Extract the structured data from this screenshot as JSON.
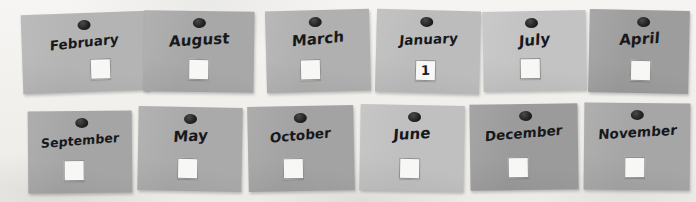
{
  "board": {
    "name": "month-cards-board",
    "background_color": "#f2f1ee",
    "pin_color": "#1f1f1f",
    "checkbox_color": "#f7f7f5",
    "ink_color": "#17181a"
  },
  "cards": [
    {
      "month": "February",
      "color": "#b4b4b4",
      "mark": "",
      "x": 22,
      "y": 13,
      "w": 126,
      "h": 79,
      "rot": -2.0,
      "pin_left": 50,
      "box_left": 62
    },
    {
      "month": "August",
      "color": "#a8a8a8",
      "mark": "",
      "x": 144,
      "y": 11,
      "w": 110,
      "h": 81,
      "rot": 0.8,
      "pin_left": 50,
      "box_left": 50
    },
    {
      "month": "March",
      "color": "#b0b0b0",
      "mark": "",
      "x": 266,
      "y": 10,
      "w": 104,
      "h": 82,
      "rot": -1.5,
      "pin_left": 48,
      "box_left": 42
    },
    {
      "month": "January",
      "color": "#bcbcbc",
      "mark": "1",
      "x": 376,
      "y": 10,
      "w": 104,
      "h": 83,
      "rot": 1.5,
      "pin_left": 48,
      "box_left": 48
    },
    {
      "month": "July",
      "color": "#c3c3c3",
      "mark": "",
      "x": 483,
      "y": 11,
      "w": 103,
      "h": 80,
      "rot": -1.0,
      "pin_left": 48,
      "box_left": 46
    },
    {
      "month": "April",
      "color": "#9d9d9d",
      "mark": "",
      "x": 589,
      "y": 10,
      "w": 100,
      "h": 83,
      "rot": 1.2,
      "pin_left": 54,
      "box_left": 52
    },
    {
      "month": "September",
      "color": "#a5a5a5",
      "mark": "",
      "x": 28,
      "y": 111,
      "w": 104,
      "h": 82,
      "rot": -0.5,
      "pin_left": 52,
      "box_left": 44
    },
    {
      "month": "May",
      "color": "#aaaaaa",
      "mark": "",
      "x": 138,
      "y": 107,
      "w": 104,
      "h": 84,
      "rot": 1.0,
      "pin_left": 50,
      "box_left": 48
    },
    {
      "month": "October",
      "color": "#a3a3a3",
      "mark": "",
      "x": 248,
      "y": 106,
      "w": 106,
      "h": 85,
      "rot": -1.2,
      "pin_left": 50,
      "box_left": 42
    },
    {
      "month": "June",
      "color": "#c0c0c0",
      "mark": "",
      "x": 360,
      "y": 105,
      "w": 104,
      "h": 86,
      "rot": 1.0,
      "pin_left": 52,
      "box_left": 48
    },
    {
      "month": "December",
      "color": "#9b9b9b",
      "mark": "",
      "x": 470,
      "y": 104,
      "w": 108,
      "h": 86,
      "rot": -0.8,
      "pin_left": 52,
      "box_left": 44
    },
    {
      "month": "November",
      "color": "#a6a6a6",
      "mark": "",
      "x": 584,
      "y": 103,
      "w": 106,
      "h": 87,
      "rot": 0.6,
      "pin_left": 50,
      "box_left": 48
    }
  ]
}
